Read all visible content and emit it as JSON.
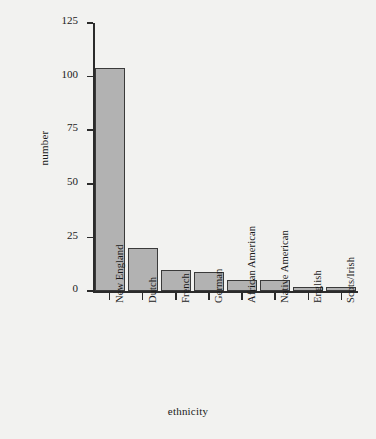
{
  "chart_data": {
    "type": "bar",
    "title": "",
    "subtitle": "",
    "xlabel": "ethnicity",
    "ylabel": "number",
    "categories": [
      "New England",
      "Dutch",
      "French",
      "German",
      "African American",
      "Native American",
      "English",
      "Scots/Irish"
    ],
    "values": [
      104,
      20,
      10,
      9,
      5,
      5,
      2,
      2
    ],
    "ylim": [
      0,
      125
    ],
    "yticks": [
      0,
      25,
      50,
      75,
      100,
      125
    ],
    "ytick_labels": [
      "0",
      "25",
      "50",
      "75",
      "100",
      "125"
    ],
    "grid": false,
    "legend": null,
    "bar_fill_color": "#b2b2b2",
    "bar_edge_color": "#3a3a3a",
    "background_color": "#f2f2f0",
    "text_color": "#1a1a1a"
  }
}
